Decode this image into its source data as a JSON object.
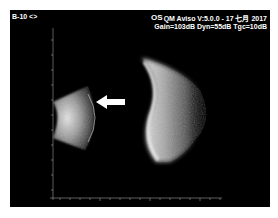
{
  "header": {
    "probe_label": "B-10 <>",
    "eye_label": "OS",
    "device_version": "QM  Aviso V:5.0.0 - 17 七月 2017",
    "settings": "Gain=103dB Dyn=55dB Tgc=10dB"
  },
  "scan": {
    "mode": "B-scan ultrasound",
    "annotation": "white arrow pointing left",
    "background_color": "#000000",
    "echo_color": "#ffffff"
  }
}
